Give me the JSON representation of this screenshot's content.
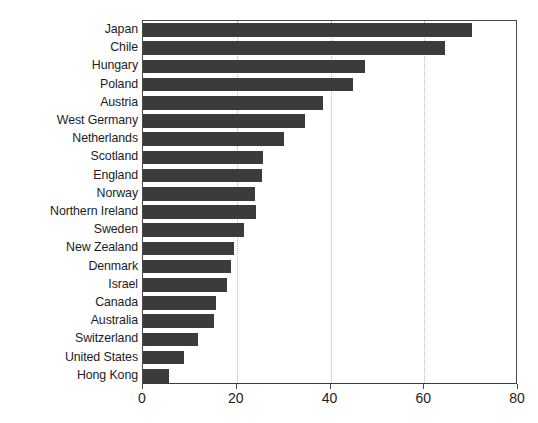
{
  "chart_data": {
    "type": "bar",
    "orientation": "horizontal",
    "title": "",
    "subtitle": "",
    "xlabel": "",
    "ylabel": "",
    "xlim": [
      0,
      80
    ],
    "xticks": [
      0,
      20,
      40,
      60,
      80
    ],
    "xticklabels": [
      "0",
      "20",
      "40",
      "60",
      "80"
    ],
    "grid": "vertical-dotted",
    "legend": "none",
    "bar_color": "#3b3b3b",
    "axis_color": "#4a4a4a",
    "grid_color": "#b9b9b9",
    "categories": [
      "Japan",
      "Chile",
      "Hungary",
      "Poland",
      "Austria",
      "West Germany",
      "Netherlands",
      "Scotland",
      "England",
      "Norway",
      "Northern Ireland",
      "Sweden",
      "New Zealand",
      "Denmark",
      "Israel",
      "Canada",
      "Australia",
      "Switzerland",
      "United States",
      "Hong Kong"
    ],
    "values": [
      70.1,
      64.4,
      47.4,
      44.8,
      38.5,
      34.6,
      30.1,
      25.5,
      25.4,
      23.8,
      24.0,
      21.5,
      19.4,
      18.7,
      18.0,
      15.6,
      15.2,
      11.8,
      8.8,
      5.5
    ]
  }
}
